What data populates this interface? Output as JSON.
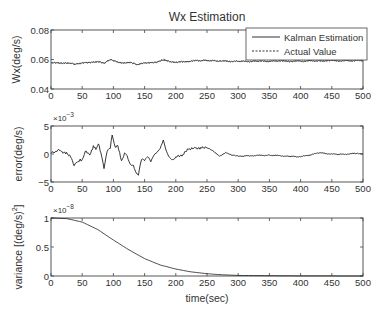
{
  "figure": {
    "title": "Wx Estimation",
    "xlabel": "time(sec)"
  },
  "chart_data": [
    {
      "type": "line",
      "title": "Wx Estimation",
      "xlabel": "",
      "ylabel": "Wx(deg/s)",
      "xlim": [
        0,
        500
      ],
      "ylim": [
        0.04,
        0.08
      ],
      "xticks": [
        "0",
        "50",
        "100",
        "150",
        "200",
        "250",
        "300",
        "350",
        "400",
        "450",
        "500"
      ],
      "yticks": [
        "0.04",
        "0.06",
        "0.08"
      ],
      "grid": false,
      "legend": {
        "position": "upper right",
        "entries": [
          "Kalman Estimation",
          "Actual Value"
        ]
      },
      "x": [
        0,
        10,
        20,
        30,
        37,
        45,
        55,
        65,
        75,
        85,
        90,
        97,
        105,
        115,
        125,
        135,
        140,
        150,
        160,
        170,
        180,
        190,
        200,
        215,
        230,
        250,
        270,
        300,
        330,
        360,
        400,
        430,
        470,
        500
      ],
      "series": [
        {
          "name": "Kalman Estimation",
          "style": "solid",
          "values": [
            0.0578,
            0.0579,
            0.0577,
            0.0575,
            0.0568,
            0.0572,
            0.058,
            0.0583,
            0.0586,
            0.0574,
            0.059,
            0.06,
            0.0585,
            0.0578,
            0.0582,
            0.057,
            0.0566,
            0.0576,
            0.058,
            0.0584,
            0.0595,
            0.0585,
            0.058,
            0.0586,
            0.0592,
            0.0594,
            0.059,
            0.0587,
            0.0588,
            0.0589,
            0.0589,
            0.0592,
            0.0592,
            0.0593
          ]
        },
        {
          "name": "Actual Value",
          "style": "dashed",
          "values": [
            0.0577,
            0.0578,
            0.0576,
            0.0574,
            0.0566,
            0.057,
            0.0578,
            0.0582,
            0.0585,
            0.0572,
            0.0588,
            0.0598,
            0.0583,
            0.0576,
            0.058,
            0.0568,
            0.0564,
            0.0575,
            0.0579,
            0.0583,
            0.0603,
            0.0583,
            0.0579,
            0.0585,
            0.059,
            0.0593,
            0.0589,
            0.0586,
            0.0587,
            0.0588,
            0.0588,
            0.0591,
            0.0591,
            0.0592
          ]
        }
      ]
    },
    {
      "type": "line",
      "title": "",
      "xlabel": "",
      "ylabel": "error(deg/s)",
      "y_multiplier": "×10^-3",
      "xlim": [
        0,
        500
      ],
      "ylim": [
        -5,
        5
      ],
      "xticks": [
        "0",
        "50",
        "100",
        "150",
        "200",
        "250",
        "300",
        "350",
        "400",
        "450",
        "500"
      ],
      "yticks": [
        "-5",
        "0",
        "5"
      ],
      "grid": false,
      "x": [
        0,
        8,
        15,
        25,
        33,
        37,
        42,
        50,
        55,
        62,
        68,
        72,
        76,
        80,
        85,
        90,
        95,
        98,
        103,
        107,
        113,
        118,
        122,
        127,
        132,
        137,
        140,
        145,
        150,
        155,
        160,
        165,
        170,
        175,
        180,
        185,
        190,
        195,
        200,
        210,
        220,
        230,
        240,
        250,
        260,
        270,
        280,
        290,
        300,
        320,
        350,
        380,
        400,
        430,
        460,
        490,
        500
      ],
      "series": [
        {
          "name": "error",
          "style": "solid",
          "values": [
            0.1,
            0.5,
            0.6,
            0.3,
            -0.8,
            -2.1,
            -1.5,
            -1.0,
            0.5,
            -0.2,
            1.5,
            0.8,
            1.8,
            0.2,
            -2.6,
            0.5,
            1.0,
            3.4,
            1.2,
            1.5,
            -1.2,
            0.2,
            -0.3,
            -1.8,
            -2.0,
            -3.5,
            -3.8,
            -1.0,
            -1.2,
            -0.5,
            -1.4,
            -0.2,
            0.3,
            1.0,
            2.5,
            0.5,
            -0.6,
            -1.0,
            -0.5,
            -0.4,
            0.8,
            1.2,
            1.2,
            1.1,
            0.5,
            -0.4,
            0.3,
            -0.2,
            -0.4,
            -0.3,
            -0.2,
            -0.4,
            -0.5,
            0.2,
            -0.1,
            0.1,
            0.0
          ]
        }
      ]
    },
    {
      "type": "line",
      "title": "",
      "xlabel": "time(sec)",
      "ylabel": "variance [(deg/s)^2]",
      "y_multiplier": "×10^-8",
      "xlim": [
        0,
        500
      ],
      "ylim": [
        0,
        1
      ],
      "xticks": [
        "0",
        "50",
        "100",
        "150",
        "200",
        "250",
        "300",
        "350",
        "400",
        "450",
        "500"
      ],
      "yticks": [
        "0",
        "0.5",
        "1"
      ],
      "grid": false,
      "x": [
        0,
        25,
        50,
        75,
        100,
        125,
        150,
        175,
        200,
        225,
        250,
        275,
        300,
        350,
        400,
        450,
        500
      ],
      "series": [
        {
          "name": "variance",
          "style": "solid",
          "values": [
            1.0,
            0.99,
            0.93,
            0.8,
            0.62,
            0.45,
            0.3,
            0.19,
            0.12,
            0.07,
            0.04,
            0.02,
            0.01,
            0.005,
            0.002,
            0.001,
            0.0
          ]
        }
      ]
    }
  ]
}
